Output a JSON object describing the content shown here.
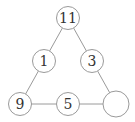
{
  "diagram": {
    "type": "number-triangle-puzzle",
    "nodes": [
      {
        "id": "top",
        "label": "11",
        "x": 68,
        "y": 18,
        "r": 11.5
      },
      {
        "id": "mid-left",
        "label": "1",
        "x": 44,
        "y": 61,
        "r": 11.5
      },
      {
        "id": "mid-right",
        "label": "3",
        "x": 92,
        "y": 61,
        "r": 11.5
      },
      {
        "id": "bottom-left",
        "label": "9",
        "x": 20,
        "y": 104,
        "r": 11.5
      },
      {
        "id": "bottom-mid",
        "label": "5",
        "x": 68,
        "y": 104,
        "r": 11.5
      },
      {
        "id": "bottom-right",
        "label": "",
        "x": 116,
        "y": 104,
        "r": 13
      }
    ],
    "edges": [
      [
        "top",
        "mid-left"
      ],
      [
        "mid-left",
        "bottom-left"
      ],
      [
        "top",
        "mid-right"
      ],
      [
        "mid-right",
        "bottom-right"
      ],
      [
        "bottom-left",
        "bottom-mid"
      ],
      [
        "bottom-mid",
        "bottom-right"
      ]
    ]
  }
}
